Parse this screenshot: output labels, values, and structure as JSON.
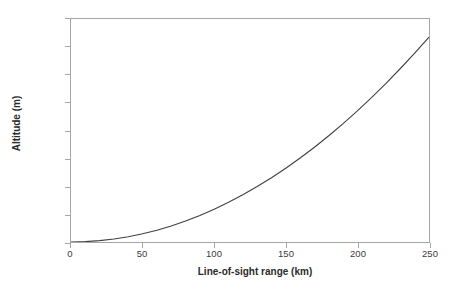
{
  "chart_data": {
    "type": "line",
    "title": "",
    "xlabel": "Line-of-sight range (km)",
    "ylabel": "Altitude (m)",
    "xlim": [
      0,
      250
    ],
    "ylim": [
      0,
      4000
    ],
    "grid": false,
    "legend": false,
    "x_ticks": [
      0,
      50,
      100,
      150,
      200,
      250
    ],
    "x_tick_labels": [
      "0",
      "50",
      "100",
      "150",
      "200",
      "250"
    ],
    "y_ticks": [
      0,
      500,
      1000,
      1500,
      2000,
      2500,
      3000,
      3500,
      4000
    ],
    "y_tick_labels": [
      "0",
      "500",
      "1,000",
      "1,500",
      "2,000",
      "2,500",
      "3,000",
      "3,500",
      "4,000"
    ],
    "line_color": "#404040",
    "axis_color": "#a6a6a6",
    "series": [
      {
        "name": "Altitude vs line-of-sight range",
        "x": [
          0,
          10,
          20,
          30,
          40,
          50,
          60,
          70,
          80,
          90,
          100,
          110,
          120,
          130,
          140,
          150,
          160,
          170,
          180,
          190,
          200,
          210,
          220,
          230,
          240,
          250
        ],
        "values": [
          0,
          6,
          24,
          53,
          94,
          147,
          212,
          288,
          376,
          476,
          588,
          712,
          847,
          994,
          1153,
          1324,
          1506,
          1700,
          1906,
          2124,
          2353,
          2594,
          2847,
          3112,
          3388,
          3676
        ]
      }
    ]
  },
  "axis": {
    "x_title": "Line-of-sight range (km)",
    "y_title": "Altitude (m)"
  }
}
